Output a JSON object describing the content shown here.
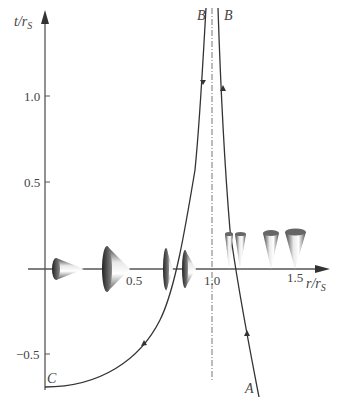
{
  "diagram": {
    "title": "",
    "axes": {
      "y_label_num": "t",
      "y_label_den": "r",
      "y_label_sub": "S",
      "x_label_num": "r",
      "x_label_den": "r",
      "x_label_sub": "S"
    },
    "y_ticks": [
      {
        "label": "1.0",
        "value": 1.0
      },
      {
        "label": "0.5",
        "value": 0.5
      },
      {
        "label": "−0.5",
        "value": -0.5
      }
    ],
    "x_ticks": [
      {
        "label": "0.5",
        "value": 0.5
      },
      {
        "label": "1.0",
        "value": 1.0
      },
      {
        "label": "1.5",
        "value": 1.5
      }
    ],
    "points": {
      "A": "A",
      "B_left": "B",
      "B_right": "B",
      "C": "C"
    },
    "horizon": {
      "r": 1.0,
      "style": "dash-dot"
    },
    "light_cones": [
      {
        "r": 0.12,
        "orientation": "right",
        "size": "medium"
      },
      {
        "r": 0.45,
        "orientation": "right",
        "size": "large"
      },
      {
        "r": 0.83,
        "orientation": "right",
        "size": "narrow"
      },
      {
        "r": 0.92,
        "orientation": "right",
        "size": "medium"
      },
      {
        "r": 1.1,
        "orientation": "up",
        "size": "thin"
      },
      {
        "r": 1.17,
        "orientation": "up",
        "size": "thin"
      },
      {
        "r": 1.37,
        "orientation": "up",
        "size": "medium"
      },
      {
        "r": 1.51,
        "orientation": "up",
        "size": "large"
      }
    ],
    "colors": {
      "line": "#333333",
      "axis": "#555555",
      "cone_dark": "#2a2a2a",
      "cone_light": "#f2f2f2"
    }
  }
}
